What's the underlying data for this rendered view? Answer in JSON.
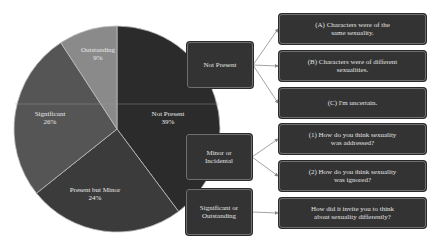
{
  "chart_data": {
    "type": "pie",
    "title": "",
    "start_angle_deg": 0,
    "direction": "clockwise",
    "slices": [
      {
        "label": "Not Present",
        "value": 39,
        "display": "39%",
        "color": "#2b2b2b"
      },
      {
        "label": "Present but Minor",
        "value": 24,
        "display": "24%",
        "color": "#3b3b3b"
      },
      {
        "label": "Significant",
        "value": 26,
        "display": "26%",
        "color": "#555555"
      },
      {
        "label": "Outstanding",
        "value": 9,
        "display": "9%",
        "color": "#8a8a8a"
      }
    ]
  },
  "pie_labels": {
    "not_present": {
      "name": "Not Present",
      "pct": "39%"
    },
    "minor": {
      "name": "Present but Minor",
      "pct": "24%"
    },
    "significant": {
      "name": "Significant",
      "pct": "26%"
    },
    "outstanding": {
      "name": "Outstanding",
      "pct": "9%"
    }
  },
  "flow": {
    "categories": [
      {
        "label": "Not Present"
      },
      {
        "label": "Minor or Incidental"
      },
      {
        "label": "Significant or Outstanding"
      }
    ],
    "questions": [
      {
        "label": "(A) Characters were of the same sexuality."
      },
      {
        "label": "(B) Characters were of different sexualities."
      },
      {
        "label": "(C) I'm uncertain."
      },
      {
        "label": "(1) How do you think sexuality was addressed?"
      },
      {
        "label": "(2) How do you think sexuality was ignored?"
      },
      {
        "label": "How did it invite you to think about sexuality differently?"
      }
    ]
  },
  "colors": {
    "box_fill": "#333333",
    "box_border": "#6f6f6f",
    "arrow": "#8a8a8a",
    "text": "#e2e2e2"
  }
}
